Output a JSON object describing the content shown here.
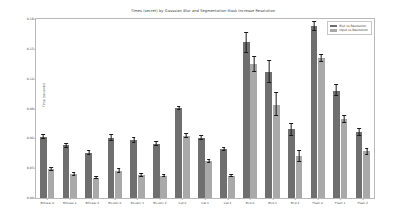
{
  "chart_data": {
    "type": "bar",
    "title": "Times (secret) by Gaussian Blur and Segmentation Mask Increase Resolution",
    "xlabel": "",
    "ylabel": "Time (seconds)",
    "ylim": [
      0.0,
      0.18
    ],
    "yticks": [
      0.0,
      0.03,
      0.06,
      0.09,
      0.12,
      0.15,
      0.18
    ],
    "ytick_labels": [
      "0.00",
      "0.03",
      "0.06",
      "0.09",
      "0.12",
      "0.15",
      "0.18"
    ],
    "grid": false,
    "legend_position": "upper-right",
    "categories": [
      "Bilinear 0",
      "Bilinear 1",
      "Bilinear 2",
      "Bicubic 0",
      "Bicubic 1",
      "Bicubic 2",
      "Cat 0",
      "Cat 1",
      "Cat 2",
      "Bird 0",
      "Bird 1",
      "Bird 2",
      "Flash 0",
      "Flash 1",
      "Flash 2"
    ],
    "series": [
      {
        "name": "Blur vs Resolution",
        "color": "#6f6f6f",
        "values": [
          0.0615,
          0.053,
          0.0455,
          0.0605,
          0.058,
          0.0545,
          0.0905,
          0.0605,
          0.049,
          0.1565,
          0.127,
          0.069,
          0.173,
          0.108,
          0.066
        ],
        "errors": [
          0.0022,
          0.002,
          0.002,
          0.003,
          0.0025,
          0.0022,
          0.0015,
          0.0018,
          0.0016,
          0.01,
          0.0115,
          0.006,
          0.0045,
          0.0055,
          0.0035
        ]
      },
      {
        "name": "Input vs Resolution",
        "color": "#a9a9a9",
        "values": [
          0.029,
          0.024,
          0.0205,
          0.0275,
          0.023,
          0.0225,
          0.0625,
          0.0375,
          0.0225,
          0.1345,
          0.094,
          0.0425,
          0.141,
          0.079,
          0.047
        ],
        "errors": [
          0.002,
          0.0012,
          0.0014,
          0.0018,
          0.0012,
          0.0012,
          0.0018,
          0.0015,
          0.001,
          0.0075,
          0.0115,
          0.0055,
          0.0035,
          0.0035,
          0.003
        ]
      }
    ]
  },
  "legend": {
    "entries": [
      {
        "label": "Blur vs Resolution"
      },
      {
        "label": "Input vs Resolution"
      }
    ]
  }
}
